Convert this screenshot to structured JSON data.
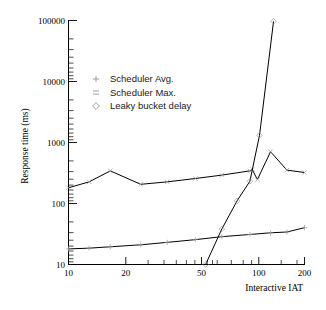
{
  "figure": {
    "background_color": "#ffffff",
    "line_color": "#000000",
    "marker_color": "#9a9a9a"
  },
  "axes": {
    "y_title": "Response time (ms)",
    "x_title": "Interactive IAT",
    "y_ticks": [
      "10",
      "100",
      "1000",
      "10000",
      "100000"
    ],
    "x_ticks": [
      "10",
      "20",
      "50",
      "100",
      "200"
    ]
  },
  "legend": {
    "position": "upper-left-inside",
    "entries": [
      {
        "marker": "plus-icon",
        "glyph": "+",
        "label": "Scheduler Avg."
      },
      {
        "marker": "cross-icon",
        "glyph": "×",
        "label": "Scheduler Max."
      },
      {
        "marker": "diamond-icon",
        "glyph": "◇",
        "label": "Leaky bucket delay"
      }
    ]
  },
  "chart_data": {
    "type": "line",
    "title": "",
    "subtitle": "",
    "xlabel": "Interactive IAT",
    "ylabel": "Response time (ms)",
    "xscale": "log",
    "yscale": "log",
    "xlim": [
      10,
      200
    ],
    "ylim": [
      10,
      100000
    ],
    "xticks": [
      10,
      20,
      50,
      100,
      200
    ],
    "yticks": [
      10,
      100,
      1000,
      10000,
      100000
    ],
    "grid": false,
    "legend_position": "upper left (inside axes)",
    "series": [
      {
        "name": "Scheduler Max.",
        "marker": "×",
        "x": [
          10,
          13,
          17,
          25,
          35,
          50,
          70,
          100,
          103,
          110,
          130,
          160,
          200
        ],
        "y": [
          180,
          225,
          340,
          205,
          225,
          255,
          290,
          340,
          360,
          245,
          700,
          350,
          320
        ]
      },
      {
        "name": "Leaky bucket delay",
        "marker": "◇",
        "x": [
          57,
          70,
          85,
          100,
          113,
          135
        ],
        "y": [
          10,
          38,
          110,
          230,
          1300,
          95000
        ]
      },
      {
        "name": "Scheduler Avg.",
        "marker": "+",
        "x": [
          10,
          13,
          17,
          25,
          35,
          50,
          70,
          100,
          130,
          160,
          200
        ],
        "y": [
          18,
          18.5,
          19.5,
          21,
          23,
          25.5,
          28.5,
          31,
          33,
          34,
          40
        ]
      }
    ]
  }
}
